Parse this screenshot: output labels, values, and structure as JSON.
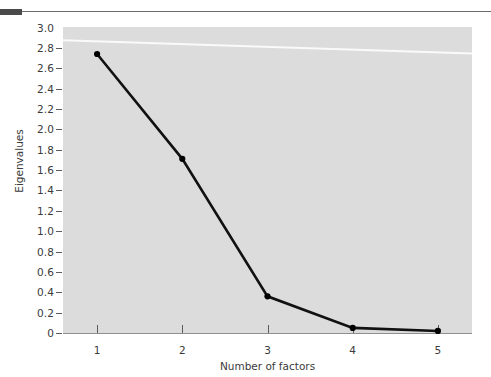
{
  "figure": {
    "top_rule": "horizontal-rule",
    "panel_color": "#dcdcdc",
    "line_color": "#111111",
    "marker_color": "#000000"
  },
  "chart_data": {
    "type": "line",
    "title": "",
    "xlabel": "Number of factors",
    "ylabel": "Eigenvalues",
    "x": [
      1,
      2,
      3,
      4,
      5
    ],
    "values": [
      2.74,
      1.71,
      0.36,
      0.05,
      0.02
    ],
    "categories": [
      "1",
      "2",
      "3",
      "4",
      "5"
    ],
    "xlim": [
      0.6,
      5.4
    ],
    "ylim": [
      0,
      3.0
    ],
    "xticks": [
      "1",
      "2",
      "3",
      "4",
      "5"
    ],
    "yticks": [
      "3.0",
      "2.8",
      "2.6",
      "2.4",
      "2.2",
      "2.0",
      "1.8",
      "1.6",
      "1.4",
      "1.2",
      "1.0",
      "0.8",
      "0.6",
      "0.4",
      "0.2",
      "0"
    ],
    "ytick_values": [
      3.0,
      2.8,
      2.6,
      2.4,
      2.2,
      2.0,
      1.8,
      1.6,
      1.4,
      1.2,
      1.0,
      0.8,
      0.6,
      0.4,
      0.2,
      0
    ],
    "grid": false,
    "legend": null,
    "markers": "filled-circle",
    "series": [
      {
        "name": "Eigenvalues",
        "values": [
          2.74,
          1.71,
          0.36,
          0.05,
          0.02
        ]
      }
    ]
  }
}
